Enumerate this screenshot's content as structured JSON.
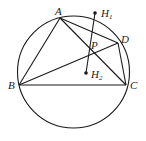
{
  "diagram": {
    "points": {
      "A": {
        "label": "A"
      },
      "B": {
        "label": "B"
      },
      "C": {
        "label": "C"
      },
      "D": {
        "label": "D"
      },
      "P": {
        "label": "P"
      },
      "H1": {
        "label": "H",
        "sub": "1"
      },
      "H2": {
        "label": "H",
        "sub": "2"
      }
    },
    "segments": [
      "AB",
      "BC",
      "CD",
      "DA",
      "AC",
      "BD",
      "H1H2"
    ],
    "colors": {
      "stroke": "#1a1a1a",
      "text": "#222222"
    }
  }
}
